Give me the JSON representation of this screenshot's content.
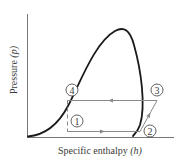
{
  "diagram": {
    "type": "pressure-enthalpy diagram (vapor-compression refrigeration cycle)",
    "x_axis_label": "Specific enthalpy",
    "x_axis_symbol": "(h)",
    "y_axis_label": "Pressure",
    "y_axis_symbol": "(p)",
    "states": [
      {
        "id": "1",
        "label": "1"
      },
      {
        "id": "2",
        "label": "2"
      },
      {
        "id": "3",
        "label": "3"
      },
      {
        "id": "4",
        "label": "4"
      }
    ],
    "colors": {
      "axes": "#777777",
      "dome": "#1a1a1a",
      "cycle": "#8a8a8a",
      "text": "#3a3a3a"
    }
  }
}
